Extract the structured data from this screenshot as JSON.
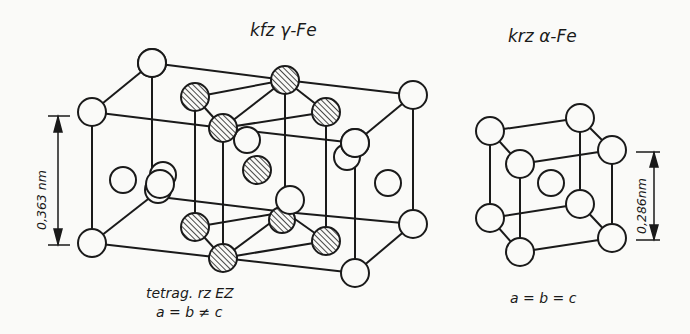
{
  "figure": {
    "left_structure": {
      "title": "kfz γ-Fe",
      "dimension_label": "0,363 nm",
      "caption_line1": "tetrag. rz EZ",
      "caption_line2": "a = b ≠ c"
    },
    "right_structure": {
      "title": "krz α-Fe",
      "dimension_label": "0,286nm",
      "caption_line1": "a = b = c"
    },
    "legend": {
      "open_circle": "Fe atom",
      "hatched_circle": "Fe atom of body-centered tetragonal sub-cell"
    },
    "colors": {
      "line": "#1a1a1a",
      "background": "#fafaf8"
    }
  }
}
